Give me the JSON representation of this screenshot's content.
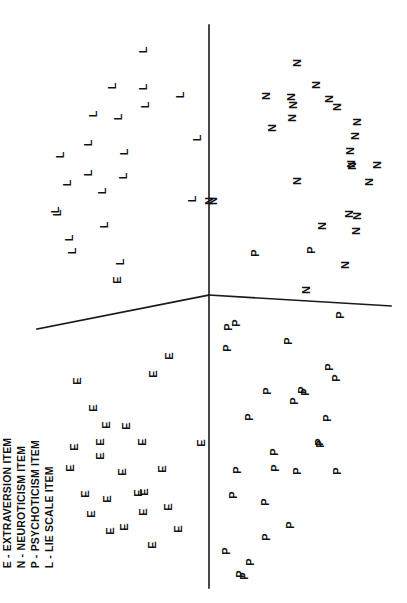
{
  "figure": {
    "background_color": "#ffffff",
    "ink_color": "#111111",
    "rotation_note": "Figure printed rotated 90 degrees counter-clockwise"
  },
  "legend": {
    "name": "item-type-legend",
    "entries": [
      {
        "symbol": "E",
        "label": "E - EXTRAVERSION ITEM"
      },
      {
        "symbol": "N",
        "label": "N - NEUROTICISM ITEM"
      },
      {
        "symbol": "P",
        "label": "P - PSYCHOTICISM ITEM"
      },
      {
        "symbol": "L",
        "label": "L - LIE SCALE ITEM"
      }
    ]
  },
  "axes": {
    "origin": {
      "x": 209,
      "y": 295
    },
    "vertical": {
      "x": 209,
      "y_top": 25,
      "y_bottom": 588
    },
    "horizontal_left": {
      "x1": 37,
      "y1": 329,
      "x2": 209,
      "y2": 295
    },
    "horizontal_right": {
      "x1": 209,
      "y1": 295,
      "x2": 391,
      "y2": 306
    },
    "tick_labels": [],
    "grid": false
  },
  "chart_data": {
    "type": "scatter",
    "title": "",
    "xlabel": "",
    "ylabel": "",
    "grid": false,
    "legend_position": "bottom-left",
    "xlim": [
      0,
      407
    ],
    "ylim": [
      0,
      603
    ],
    "note": "Coordinates are pixel positions of each plotted item letter in the rotated figure.",
    "series": [
      {
        "name": "L - LIE SCALE ITEM",
        "symbol": "L",
        "count": 22,
        "points": [
          {
            "x": 143,
            "y": 50
          },
          {
            "x": 112,
            "y": 86
          },
          {
            "x": 143,
            "y": 87
          },
          {
            "x": 180,
            "y": 95
          },
          {
            "x": 145,
            "y": 105
          },
          {
            "x": 93,
            "y": 114
          },
          {
            "x": 118,
            "y": 117
          },
          {
            "x": 197,
            "y": 138
          },
          {
            "x": 88,
            "y": 143
          },
          {
            "x": 124,
            "y": 152
          },
          {
            "x": 60,
            "y": 155
          },
          {
            "x": 88,
            "y": 173
          },
          {
            "x": 123,
            "y": 176
          },
          {
            "x": 67,
            "y": 183
          },
          {
            "x": 102,
            "y": 191
          },
          {
            "x": 192,
            "y": 199
          },
          {
            "x": 55,
            "y": 210
          },
          {
            "x": 57,
            "y": 213
          },
          {
            "x": 104,
            "y": 225
          },
          {
            "x": 69,
            "y": 238
          },
          {
            "x": 72,
            "y": 251
          },
          {
            "x": 120,
            "y": 262
          }
        ]
      },
      {
        "name": "N - NEUROTICISM ITEM",
        "symbol": "N",
        "count": 25,
        "points": [
          {
            "x": 297,
            "y": 63
          },
          {
            "x": 316,
            "y": 85
          },
          {
            "x": 266,
            "y": 96
          },
          {
            "x": 291,
            "y": 97
          },
          {
            "x": 329,
            "y": 99
          },
          {
            "x": 293,
            "y": 105
          },
          {
            "x": 337,
            "y": 107
          },
          {
            "x": 292,
            "y": 118
          },
          {
            "x": 357,
            "y": 122
          },
          {
            "x": 272,
            "y": 128
          },
          {
            "x": 355,
            "y": 136
          },
          {
            "x": 350,
            "y": 151
          },
          {
            "x": 351,
            "y": 164
          },
          {
            "x": 352,
            "y": 166
          },
          {
            "x": 377,
            "y": 165
          },
          {
            "x": 369,
            "y": 182
          },
          {
            "x": 297,
            "y": 181
          },
          {
            "x": 213,
            "y": 201
          },
          {
            "x": 349,
            "y": 214
          },
          {
            "x": 357,
            "y": 216
          },
          {
            "x": 322,
            "y": 226
          },
          {
            "x": 356,
            "y": 231
          },
          {
            "x": 345,
            "y": 265
          },
          {
            "x": 306,
            "y": 290
          },
          {
            "x": 209,
            "y": 201
          }
        ]
      },
      {
        "name": "E - EXTRAVERSION ITEM",
        "symbol": "E",
        "count": 26,
        "points": [
          {
            "x": 117,
            "y": 280
          },
          {
            "x": 169,
            "y": 356
          },
          {
            "x": 153,
            "y": 374
          },
          {
            "x": 77,
            "y": 381
          },
          {
            "x": 93,
            "y": 408
          },
          {
            "x": 106,
            "y": 425
          },
          {
            "x": 126,
            "y": 426
          },
          {
            "x": 100,
            "y": 442
          },
          {
            "x": 142,
            "y": 442
          },
          {
            "x": 74,
            "y": 447
          },
          {
            "x": 201,
            "y": 443
          },
          {
            "x": 100,
            "y": 456
          },
          {
            "x": 162,
            "y": 469
          },
          {
            "x": 122,
            "y": 472
          },
          {
            "x": 144,
            "y": 492
          },
          {
            "x": 85,
            "y": 494
          },
          {
            "x": 107,
            "y": 499
          },
          {
            "x": 143,
            "y": 512
          },
          {
            "x": 91,
            "y": 514
          },
          {
            "x": 124,
            "y": 527
          },
          {
            "x": 110,
            "y": 531
          },
          {
            "x": 168,
            "y": 507
          },
          {
            "x": 178,
            "y": 529
          },
          {
            "x": 152,
            "y": 545
          },
          {
            "x": 138,
            "y": 493
          },
          {
            "x": 70,
            "y": 468
          }
        ]
      },
      {
        "name": "P - PSYCHOTICISM ITEM",
        "symbol": "P",
        "count": 30,
        "points": [
          {
            "x": 255,
            "y": 253
          },
          {
            "x": 311,
            "y": 250
          },
          {
            "x": 340,
            "y": 315
          },
          {
            "x": 236,
            "y": 323
          },
          {
            "x": 228,
            "y": 327
          },
          {
            "x": 227,
            "y": 348
          },
          {
            "x": 288,
            "y": 341
          },
          {
            "x": 329,
            "y": 367
          },
          {
            "x": 336,
            "y": 378
          },
          {
            "x": 267,
            "y": 391
          },
          {
            "x": 302,
            "y": 390
          },
          {
            "x": 305,
            "y": 392
          },
          {
            "x": 294,
            "y": 401
          },
          {
            "x": 249,
            "y": 417
          },
          {
            "x": 327,
            "y": 418
          },
          {
            "x": 319,
            "y": 442
          },
          {
            "x": 320,
            "y": 444
          },
          {
            "x": 274,
            "y": 452
          },
          {
            "x": 275,
            "y": 468
          },
          {
            "x": 237,
            "y": 470
          },
          {
            "x": 297,
            "y": 471
          },
          {
            "x": 337,
            "y": 471
          },
          {
            "x": 233,
            "y": 495
          },
          {
            "x": 265,
            "y": 502
          },
          {
            "x": 290,
            "y": 525
          },
          {
            "x": 266,
            "y": 537
          },
          {
            "x": 226,
            "y": 551
          },
          {
            "x": 250,
            "y": 562
          },
          {
            "x": 240,
            "y": 574
          },
          {
            "x": 244,
            "y": 576
          }
        ]
      }
    ]
  }
}
